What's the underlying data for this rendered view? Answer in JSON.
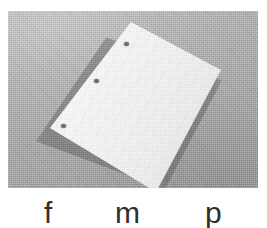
{
  "figure": {
    "name": "three-hole-punched-paper-photo",
    "width": 267,
    "height": 228
  },
  "photo": {
    "subject": "sheet-of-paper",
    "background_color": "#a9a9a9",
    "paper_color": "#f7f7f7",
    "hole_color": "#6b6b6b",
    "holes": [
      {
        "id": "hole-1",
        "label": "top-binder-hole"
      },
      {
        "id": "hole-2",
        "label": "middle-binder-hole"
      },
      {
        "id": "hole-3",
        "label": "bottom-binder-hole"
      }
    ]
  },
  "caption": {
    "text_color": "#2e2e2e",
    "letters": [
      {
        "id": "letter-f",
        "label": "f"
      },
      {
        "id": "letter-m",
        "label": "m"
      },
      {
        "id": "letter-p",
        "label": "p"
      }
    ]
  }
}
